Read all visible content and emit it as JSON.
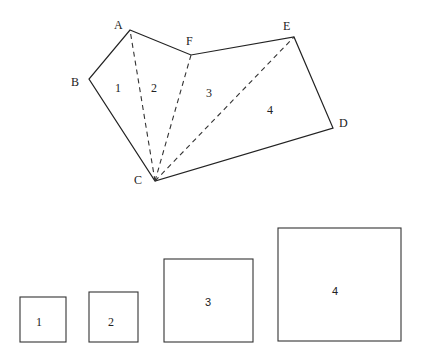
{
  "diagram": {
    "vertices": {
      "A": {
        "label": "A",
        "x": 130,
        "y": 30
      },
      "B": {
        "label": "B",
        "x": 89,
        "y": 79
      },
      "C": {
        "label": "C",
        "x": 155,
        "y": 181
      },
      "D": {
        "label": "D",
        "x": 333,
        "y": 128
      },
      "E": {
        "label": "E",
        "x": 294,
        "y": 37
      },
      "F": {
        "label": "F",
        "x": 191,
        "y": 55
      }
    },
    "polygon_order": [
      "A",
      "F",
      "E",
      "D",
      "C",
      "B"
    ],
    "diagonals": [
      [
        "C",
        "A"
      ],
      [
        "C",
        "F"
      ],
      [
        "C",
        "E"
      ]
    ],
    "regions": [
      {
        "label": "1"
      },
      {
        "label": "2"
      },
      {
        "label": "3"
      },
      {
        "label": "4"
      }
    ],
    "squares": [
      {
        "label": "1"
      },
      {
        "label": "2"
      },
      {
        "label": "3"
      },
      {
        "label": "4"
      }
    ]
  }
}
